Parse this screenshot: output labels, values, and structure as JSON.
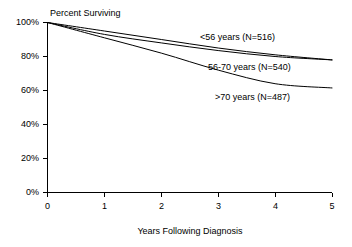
{
  "chart_data": {
    "type": "line",
    "title": "Percent Surviving",
    "xlabel": "Years Following Diagnosis",
    "ylabel": "",
    "xlim": [
      0,
      5
    ],
    "ylim": [
      0,
      100
    ],
    "grid": false,
    "legend_position": "inline-annotations",
    "x_ticks": [
      "0",
      "1",
      "2",
      "3",
      "4",
      "5"
    ],
    "x_tick_values": [
      0,
      1,
      2,
      3,
      4,
      5
    ],
    "y_ticks": [
      "0%",
      "20%",
      "40%",
      "60%",
      "80%",
      "100%"
    ],
    "y_tick_values": [
      0,
      20,
      40,
      60,
      80,
      100
    ],
    "x": [
      0,
      1,
      2,
      3,
      4,
      5
    ],
    "series": [
      {
        "name": "<56 years (N=516)",
        "label": "<56 years (N=516)",
        "values": [
          100,
          95,
          90,
          85,
          81,
          78
        ],
        "label_x": 200,
        "label_y": 40
      },
      {
        "name": "56-70 years (N=540)",
        "label": "56-70 years (N=540)",
        "values": [
          100,
          93,
          88,
          83.5,
          80,
          78
        ],
        "label_x": 208,
        "label_y": 70
      },
      {
        "name": ">70 years (N=487)",
        "label": ">70 years (N=487)",
        "values": [
          100,
          91,
          82,
          72,
          64,
          61.5
        ],
        "label_x": 215,
        "label_y": 100
      }
    ],
    "colors": {
      "line": "#000000",
      "axis": "#000000",
      "text": "#000000",
      "background": "#ffffff"
    }
  },
  "axes": {
    "y_axis_name": "percent-surviving-axis",
    "x_axis_name": "years-following-diagnosis-axis"
  }
}
